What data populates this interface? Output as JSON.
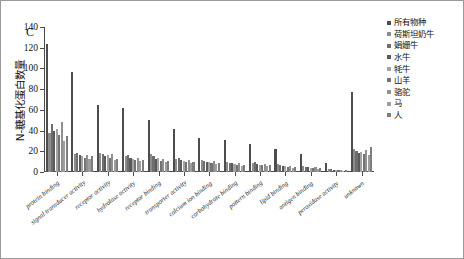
{
  "panel": {
    "letter": "C"
  },
  "axes": {
    "ylabel": "N-糖基化蛋白数量",
    "yticks": [
      "0",
      "20",
      "40",
      "60",
      "80",
      "100",
      "120",
      "140"
    ]
  },
  "legend": {
    "items": [
      {
        "label": "所有物种",
        "color": "#4d4d4d"
      },
      {
        "label": "荷斯坦奶牛",
        "color": "#8c8c8c"
      },
      {
        "label": "娟姗牛",
        "color": "#6e6e6e"
      },
      {
        "label": "水牛",
        "color": "#5a5a5a"
      },
      {
        "label": "牦牛",
        "color": "#a3a3a3"
      },
      {
        "label": "山羊",
        "color": "#747474"
      },
      {
        "label": "骆驼",
        "color": "#909090"
      },
      {
        "label": "马",
        "color": "#9e9e9e"
      },
      {
        "label": "人",
        "color": "#7d7d7d"
      }
    ]
  },
  "chart_data": {
    "type": "bar",
    "title": "",
    "xlabel": "",
    "ylabel": "N-糖基化蛋白数量",
    "ylim": [
      0,
      140
    ],
    "grid": false,
    "legend_position": "right",
    "categories": [
      "protein binding",
      "signal transducer activity",
      "receptor activity",
      "hydrolase activity",
      "receptor binding",
      "transporter activity",
      "calcium ion binding",
      "carbohydrate binding",
      "pattern binding",
      "lipid binding",
      "antigen binding",
      "peroxidase activity",
      "unknown"
    ],
    "series": [
      {
        "name": "所有物种",
        "color": "#4d4d4d",
        "values": [
          124,
          97,
          65,
          62,
          50,
          42,
          33,
          31,
          27,
          22,
          17,
          9,
          77
        ]
      },
      {
        "name": "荷斯坦奶牛",
        "color": "#8c8c8c",
        "values": [
          38,
          17,
          18,
          15,
          17,
          13,
          12,
          10,
          9,
          8,
          6,
          3,
          22
        ]
      },
      {
        "name": "娟姗牛",
        "color": "#6e6e6e",
        "values": [
          46,
          18,
          17,
          16,
          15,
          14,
          11,
          9,
          10,
          7,
          5,
          3,
          20
        ]
      },
      {
        "name": "水牛",
        "color": "#5a5a5a",
        "values": [
          40,
          16,
          15,
          14,
          13,
          12,
          10,
          9,
          8,
          6,
          5,
          2,
          18
        ]
      },
      {
        "name": "牦牛",
        "color": "#a3a3a3",
        "values": [
          42,
          15,
          16,
          13,
          14,
          11,
          10,
          8,
          7,
          6,
          4,
          2,
          19
        ]
      },
      {
        "name": "山羊",
        "color": "#747474",
        "values": [
          36,
          14,
          14,
          12,
          11,
          10,
          9,
          7,
          7,
          5,
          4,
          2,
          17
        ]
      },
      {
        "name": "骆驼",
        "color": "#909090",
        "values": [
          48,
          16,
          17,
          14,
          13,
          12,
          11,
          9,
          8,
          6,
          5,
          2,
          21
        ]
      },
      {
        "name": "马",
        "color": "#9e9e9e",
        "values": [
          30,
          13,
          12,
          11,
          10,
          9,
          8,
          6,
          6,
          4,
          3,
          1,
          16
        ]
      },
      {
        "name": "人",
        "color": "#7d7d7d",
        "values": [
          35,
          15,
          13,
          12,
          11,
          10,
          9,
          7,
          7,
          5,
          4,
          2,
          24
        ]
      }
    ]
  }
}
